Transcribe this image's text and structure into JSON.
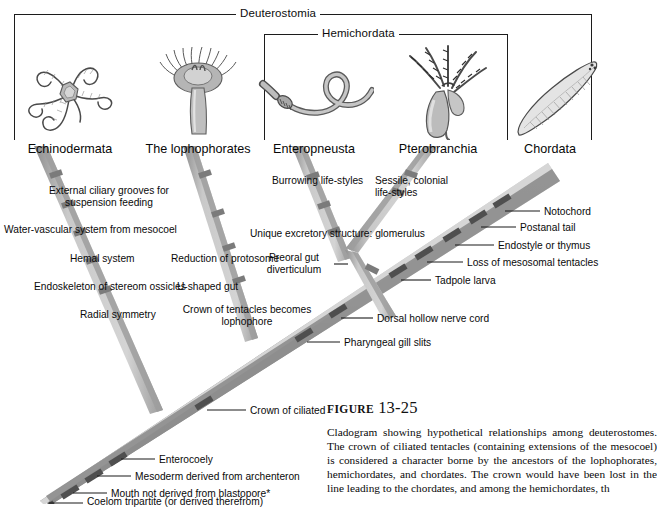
{
  "figure": {
    "label_word": "FIGURE",
    "number": "13-25",
    "caption": "Cladogram showing hypothetical relationships among deuterostomes. The crown of ciliated tentacles (containing extensions of the mesocoel) is considered a character borne by the ancestors of the lophophorates, hemichordates, and chordates. The crown would have been lost in the line leading to the chordates, and among the hemichordates, th"
  },
  "brackets": [
    {
      "name": "Deuterostomia",
      "label": "Deuterostomia"
    },
    {
      "name": "Hemichordata",
      "label": "Hemichordata"
    }
  ],
  "taxa": [
    {
      "name": "echinodermata",
      "label": "Echinodermata",
      "organism": "brittle-star-illustration"
    },
    {
      "name": "lophophorates",
      "label": "The lophophorates",
      "organism": "phoronid-illustration"
    },
    {
      "name": "enteropneusta",
      "label": "Enteropneusta",
      "organism": "acorn-worm-illustration"
    },
    {
      "name": "pterobranchia",
      "label": "Pterobranchia",
      "organism": "pterobranch-illustration"
    },
    {
      "name": "chordata",
      "label": "Chordata",
      "organism": "amphioxus-illustration"
    }
  ],
  "characters": [
    {
      "id": "c01",
      "text": "External ciliary grooves for\nsuspension feeding"
    },
    {
      "id": "c02",
      "text": "Water-vascular system from mesocoel"
    },
    {
      "id": "c03",
      "text": "Hemal system"
    },
    {
      "id": "c04",
      "text": "Endoskeleton of stereom ossicles"
    },
    {
      "id": "c05",
      "text": "Radial symmetry"
    },
    {
      "id": "c06",
      "text": "Reduction of protosome"
    },
    {
      "id": "c07",
      "text": "U-shaped gut"
    },
    {
      "id": "c08",
      "text": "Crown of tentacles becomes\nlophophore"
    },
    {
      "id": "c09",
      "text": "Burrowing life-styles"
    },
    {
      "id": "c10",
      "text": "Sessile, colonial\nlife-styles"
    },
    {
      "id": "c11",
      "text": "Unique excretory structure: glomerulus"
    },
    {
      "id": "c12",
      "text": "Preoral gut\ndiverticulum"
    },
    {
      "id": "c13",
      "text": "Notochord"
    },
    {
      "id": "c14",
      "text": "Postanal tail"
    },
    {
      "id": "c15",
      "text": "Endostyle or thymus"
    },
    {
      "id": "c16",
      "text": "Loss of mesosomal tentacles"
    },
    {
      "id": "c17",
      "text": "Tadpole larva"
    },
    {
      "id": "c18",
      "text": "Dorsal hollow nerve cord"
    },
    {
      "id": "c19",
      "text": "Pharyngeal gill slits"
    },
    {
      "id": "c20",
      "text": "Crown of ciliated tentacles containing mesocoel"
    },
    {
      "id": "c21",
      "text": "Enterocoely"
    },
    {
      "id": "c22",
      "text": "Mesoderm derived from archenteron"
    },
    {
      "id": "c23",
      "text": "Mouth not derived from blastopore*"
    },
    {
      "id": "c24",
      "text": "Coelom tripartite (or derived therefrom)"
    }
  ],
  "colors": {
    "branch_light": "#c9c9c9",
    "branch_mid": "#a9a9a9",
    "branch_dark": "#8b8b8b",
    "tick_dark": "#6f6f6f",
    "text": "#0a0a0a",
    "bracket": "#1c1c1c",
    "background": "#ffffff"
  }
}
